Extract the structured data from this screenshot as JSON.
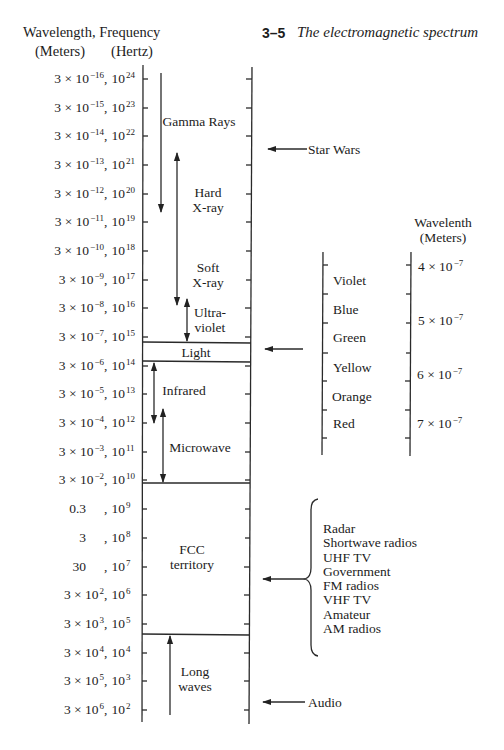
{
  "header": {
    "axis_title": "Wavelength, Frequency",
    "wavelength_unit": "(Meters)",
    "frequency_unit": "(Hertz)",
    "figure_number": "3–5",
    "figure_title": "The electromagnetic spectrum"
  },
  "scale": {
    "separator": ",",
    "rows": [
      {
        "wavelength": "3 × 10",
        "wavelength_exp": "−16",
        "frequency": "10",
        "frequency_exp": "24"
      },
      {
        "wavelength": "3 × 10",
        "wavelength_exp": "−15",
        "frequency": "10",
        "frequency_exp": "23"
      },
      {
        "wavelength": "3 × 10",
        "wavelength_exp": "−14",
        "frequency": "10",
        "frequency_exp": "22"
      },
      {
        "wavelength": "3 × 10",
        "wavelength_exp": "−13",
        "frequency": "10",
        "frequency_exp": "21"
      },
      {
        "wavelength": "3 × 10",
        "wavelength_exp": "−12",
        "frequency": "10",
        "frequency_exp": "20"
      },
      {
        "wavelength": "3 × 10",
        "wavelength_exp": "−11",
        "frequency": "10",
        "frequency_exp": "19"
      },
      {
        "wavelength": "3 × 10",
        "wavelength_exp": "−10",
        "frequency": "10",
        "frequency_exp": "18"
      },
      {
        "wavelength": "3 × 10",
        "wavelength_exp": "−9",
        "frequency": "10",
        "frequency_exp": "17"
      },
      {
        "wavelength": "3 × 10",
        "wavelength_exp": "−8",
        "frequency": "10",
        "frequency_exp": "16"
      },
      {
        "wavelength": "3 × 10",
        "wavelength_exp": "−7",
        "frequency": "10",
        "frequency_exp": "15"
      },
      {
        "wavelength": "3 × 10",
        "wavelength_exp": "−6",
        "frequency": "10",
        "frequency_exp": "14"
      },
      {
        "wavelength": "3 × 10",
        "wavelength_exp": "−5",
        "frequency": "10",
        "frequency_exp": "13"
      },
      {
        "wavelength": "3 × 10",
        "wavelength_exp": "−4",
        "frequency": "10",
        "frequency_exp": "12"
      },
      {
        "wavelength": "3 × 10",
        "wavelength_exp": "−3",
        "frequency": "10",
        "frequency_exp": "11"
      },
      {
        "wavelength": "3 × 10",
        "wavelength_exp": "−2",
        "frequency": "10",
        "frequency_exp": "10"
      },
      {
        "wavelength": "0.3",
        "wavelength_exp": "",
        "frequency": "10",
        "frequency_exp": "9"
      },
      {
        "wavelength": "3",
        "wavelength_exp": "",
        "frequency": "10",
        "frequency_exp": "8"
      },
      {
        "wavelength": "30",
        "wavelength_exp": "",
        "frequency": "10",
        "frequency_exp": "7"
      },
      {
        "wavelength": "3 × 10",
        "wavelength_exp": "2",
        "frequency": "10",
        "frequency_exp": "6"
      },
      {
        "wavelength": "3 × 10",
        "wavelength_exp": "3",
        "frequency": "10",
        "frequency_exp": "5"
      },
      {
        "wavelength": "3 × 10",
        "wavelength_exp": "4",
        "frequency": "10",
        "frequency_exp": "4"
      },
      {
        "wavelength": "3 × 10",
        "wavelength_exp": "5",
        "frequency": "10",
        "frequency_exp": "3"
      },
      {
        "wavelength": "3 × 10",
        "wavelength_exp": "6",
        "frequency": "10",
        "frequency_exp": "2"
      }
    ]
  },
  "bands": {
    "gamma_rays": "Gamma Rays",
    "hard_xray": {
      "line1": "Hard",
      "line2": "X-ray"
    },
    "soft_xray": {
      "line1": "Soft",
      "line2": "X-ray"
    },
    "ultraviolet": {
      "line1": "Ultra-",
      "line2": "violet"
    },
    "light": "Light",
    "infrared": "Infrared",
    "microwave": "Microwave",
    "fcc": {
      "line1": "FCC",
      "line2": "territory"
    },
    "long_waves": {
      "line1": "Long",
      "line2": "waves"
    }
  },
  "annotations": {
    "star_wars": "Star Wars",
    "audio": "Audio"
  },
  "visible_spectrum": {
    "heading": "Wavelenth",
    "unit": "(Meters)",
    "colors": [
      "Violet",
      "Blue",
      "Green",
      "Yellow",
      "Orange",
      "Red"
    ],
    "wavelengths": [
      {
        "base": "4 × 10",
        "exp": "−7"
      },
      {
        "base": "5 × 10",
        "exp": "−7"
      },
      {
        "base": "6 × 10",
        "exp": "−7"
      },
      {
        "base": "7 × 10",
        "exp": "−7"
      }
    ]
  },
  "fcc_uses": [
    "Radar",
    "Shortwave radios",
    "UHF TV",
    "Government",
    "FM radios",
    "VHF TV",
    "Amateur",
    "AM radios"
  ]
}
